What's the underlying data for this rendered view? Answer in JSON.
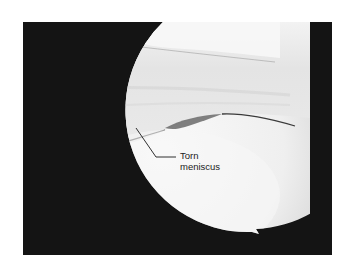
{
  "image": {
    "description": "Arthroscopic view of knee joint showing torn meniscus",
    "colors": {
      "background": "#ffffff",
      "frame": "#141414",
      "tissue_light": "#f2f2f2",
      "tissue_mid": "#e2e2e2",
      "tear_shadow": "#6a6a6a",
      "label_text": "#222222"
    }
  },
  "annotation": {
    "line1": "Torn",
    "line2": "meniscus"
  }
}
